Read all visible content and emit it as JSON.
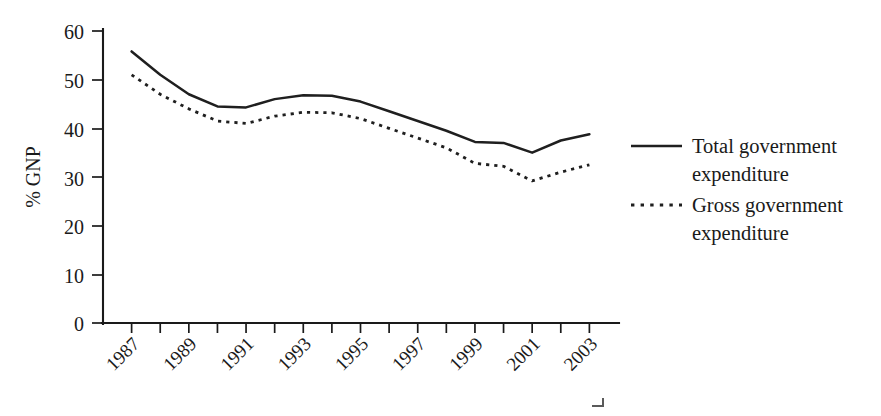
{
  "chart_data": {
    "type": "line",
    "title": "",
    "xlabel": "",
    "ylabel": "% GNP",
    "x": [
      1987,
      1988,
      1989,
      1990,
      1991,
      1992,
      1993,
      1994,
      1995,
      1996,
      1997,
      1998,
      1999,
      2000,
      2001,
      2002,
      2003
    ],
    "xlim": [
      1986,
      2004
    ],
    "ylim": [
      0,
      60
    ],
    "yticks": [
      0,
      10,
      20,
      30,
      40,
      50,
      60
    ],
    "xticks_labeled": [
      "1987",
      "1989",
      "1991",
      "1993",
      "1995",
      "1997",
      "1999",
      "2001",
      "2003"
    ],
    "xtick_minor_every": 1,
    "grid": false,
    "legend_position": "right",
    "series": [
      {
        "name": "Total government expenditure",
        "style": "solid",
        "color": "#1f1f1f",
        "values": [
          55.8,
          51.0,
          47.0,
          44.5,
          44.3,
          46.0,
          46.8,
          46.7,
          45.5,
          43.5,
          41.5,
          39.5,
          37.2,
          37.0,
          35.0,
          37.5,
          38.8
        ]
      },
      {
        "name": "Gross government expenditure",
        "style": "dotted",
        "color": "#1f1f1f",
        "values": [
          51.0,
          47.0,
          44.0,
          41.5,
          41.0,
          42.5,
          43.3,
          43.2,
          42.0,
          40.0,
          38.0,
          36.0,
          32.8,
          32.2,
          29.2,
          31.0,
          32.5
        ]
      }
    ]
  },
  "legend": {
    "entries": [
      {
        "label_line1": "Total government",
        "label_line2": "expenditure",
        "style": "solid"
      },
      {
        "label_line1": "Gross government",
        "label_line2": "expenditure",
        "style": "dotted"
      }
    ]
  },
  "axes": {
    "y_title": "% GNP",
    "y_tick_labels": [
      "60",
      "50",
      "40",
      "30",
      "20",
      "10",
      "0"
    ],
    "x_tick_labels": [
      "1987",
      "1989",
      "1991",
      "1993",
      "1995",
      "1997",
      "1999",
      "2001",
      "2003"
    ]
  }
}
